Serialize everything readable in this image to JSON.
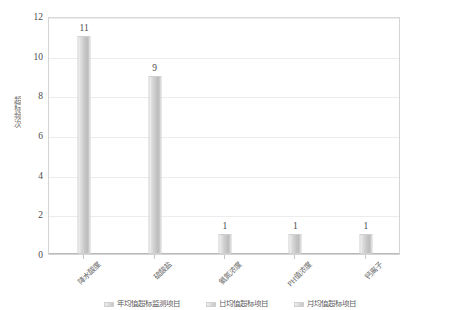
{
  "chart_data": {
    "type": "bar",
    "title": "",
    "subtitle": "",
    "xlabel": "",
    "ylabel": "超标频次",
    "categories": [
      "降水酸度",
      "硫酸盐",
      "氨氮浓度",
      "PH值浓度",
      "钙离子"
    ],
    "values": [
      11,
      9,
      1,
      1,
      1
    ],
    "data_labels": [
      "11",
      "9",
      "1",
      "1",
      "1"
    ],
    "ylim": [
      0,
      12
    ],
    "yticks": [
      0,
      2,
      4,
      6,
      8,
      10,
      12
    ],
    "ytick_labels": [
      "0",
      "2",
      "4",
      "6",
      "8",
      "10",
      "12"
    ],
    "grid": "horizontal",
    "legend_position": "bottom",
    "series": [
      {
        "name": "超标频次",
        "values": [
          11,
          9,
          1,
          1,
          1
        ],
        "color": "#c8c8c8"
      }
    ],
    "legend_entries": [
      "年均值超标监测项目",
      "日均值超标项目",
      "月均值超标项目"
    ],
    "colors": {
      "bar_light": "#f2f2f2",
      "bar_mid": "#c8c8c8",
      "bar_dark": "#bcbcbc",
      "grid": "#ececec",
      "axis": "#b9b9b9",
      "plot_border": "#d4d4d4",
      "text": "#4a4a4a",
      "background": "#ffffff"
    }
  }
}
